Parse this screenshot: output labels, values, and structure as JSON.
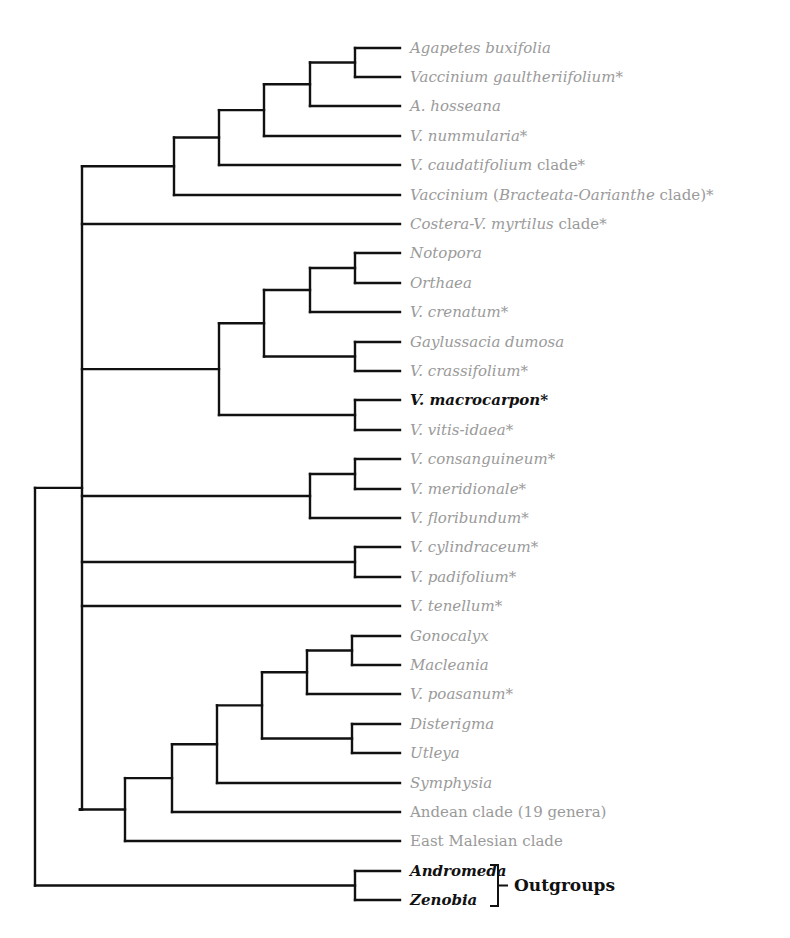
{
  "diagram": {
    "type": "phylogenetic-tree",
    "leaves": [
      {
        "parts": [
          {
            "t": "Agapetes buxifolia",
            "i": true
          }
        ],
        "y": 48
      },
      {
        "parts": [
          {
            "t": "Vaccinium gaultheriifolium",
            "i": true
          },
          {
            "t": "*",
            "i": false
          }
        ],
        "y": 77
      },
      {
        "parts": [
          {
            "t": "A. hosseana",
            "i": true
          }
        ],
        "y": 106
      },
      {
        "parts": [
          {
            "t": "V. nummularia",
            "i": true
          },
          {
            "t": "*",
            "i": false
          }
        ],
        "y": 136
      },
      {
        "parts": [
          {
            "t": "V. caudatifolium",
            "i": true
          },
          {
            "t": " clade*",
            "i": false
          }
        ],
        "y": 165
      },
      {
        "parts": [
          {
            "t": "Vaccinium",
            "i": true
          },
          {
            "t": " (",
            "i": false
          },
          {
            "t": "Bracteata-Oarianthe",
            "i": true
          },
          {
            "t": " clade)*",
            "i": false
          }
        ],
        "y": 195
      },
      {
        "parts": [
          {
            "t": "Costera-V. myrtilus",
            "i": true
          },
          {
            "t": " clade*",
            "i": false
          }
        ],
        "y": 224
      },
      {
        "parts": [
          {
            "t": "Notopora",
            "i": true
          }
        ],
        "y": 253
      },
      {
        "parts": [
          {
            "t": "Orthaea",
            "i": true
          }
        ],
        "y": 283
      },
      {
        "parts": [
          {
            "t": "V. crenatum",
            "i": true
          },
          {
            "t": "*",
            "i": false
          }
        ],
        "y": 312
      },
      {
        "parts": [
          {
            "t": "Gaylussacia dumosa",
            "i": true
          }
        ],
        "y": 342
      },
      {
        "parts": [
          {
            "t": "V. crassifolium",
            "i": true
          },
          {
            "t": "*",
            "i": false
          }
        ],
        "y": 371
      },
      {
        "parts": [
          {
            "t": "V. macrocarpon*",
            "i": true
          }
        ],
        "y": 400,
        "bold": true
      },
      {
        "parts": [
          {
            "t": "V. vitis-idaea",
            "i": true
          },
          {
            "t": "*",
            "i": false
          }
        ],
        "y": 430
      },
      {
        "parts": [
          {
            "t": "V. consanguineum",
            "i": true
          },
          {
            "t": "*",
            "i": false
          }
        ],
        "y": 459
      },
      {
        "parts": [
          {
            "t": "V. meridionale",
            "i": true
          },
          {
            "t": "*",
            "i": false
          }
        ],
        "y": 489
      },
      {
        "parts": [
          {
            "t": "V. floribundum",
            "i": true
          },
          {
            "t": "*",
            "i": false
          }
        ],
        "y": 518
      },
      {
        "parts": [
          {
            "t": "V. cylindraceum",
            "i": true
          },
          {
            "t": "*",
            "i": false
          }
        ],
        "y": 547
      },
      {
        "parts": [
          {
            "t": "V. padifolium",
            "i": true
          },
          {
            "t": "*",
            "i": false
          }
        ],
        "y": 577
      },
      {
        "parts": [
          {
            "t": "V. tenellum",
            "i": true
          },
          {
            "t": "*",
            "i": false
          }
        ],
        "y": 606
      },
      {
        "parts": [
          {
            "t": "Gonocalyx",
            "i": true
          }
        ],
        "y": 636
      },
      {
        "parts": [
          {
            "t": "Macleania",
            "i": true
          }
        ],
        "y": 665
      },
      {
        "parts": [
          {
            "t": "V. poasanum",
            "i": true
          },
          {
            "t": "*",
            "i": false
          }
        ],
        "y": 694
      },
      {
        "parts": [
          {
            "t": "Disterigma",
            "i": true
          }
        ],
        "y": 724
      },
      {
        "parts": [
          {
            "t": "Utleya",
            "i": true
          }
        ],
        "y": 753
      },
      {
        "parts": [
          {
            "t": "Symphysia",
            "i": true
          }
        ],
        "y": 783
      },
      {
        "parts": [
          {
            "t": "Andean clade (19 genera)",
            "i": false
          }
        ],
        "y": 812
      },
      {
        "parts": [
          {
            "t": "East Malesian clade",
            "i": false
          }
        ],
        "y": 841
      },
      {
        "parts": [
          {
            "t": "Andromeda",
            "i": true
          }
        ],
        "y": 871,
        "bold": true
      },
      {
        "parts": [
          {
            "t": "Zenobia",
            "i": true
          }
        ],
        "y": 900,
        "bold": true
      }
    ],
    "outgroup_label": "Outgroups",
    "colors": {
      "line": "#111111",
      "label": "#9a9a9a",
      "highlight": "#111111"
    }
  }
}
